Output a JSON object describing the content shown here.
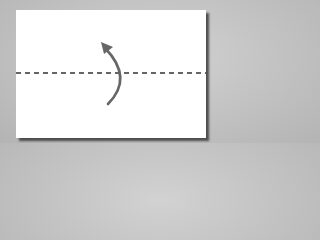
{
  "diagram": {
    "type": "origami-fold-step",
    "instruction": "valley fold in half (bottom edge up)",
    "paper": {
      "color": "#ffffff",
      "shape": "rectangle"
    },
    "fold_line": {
      "style": "dashed",
      "color": "#333333",
      "orientation": "horizontal",
      "position": "middle"
    },
    "arrow": {
      "color": "#666666",
      "direction": "up",
      "shape": "curved"
    },
    "background_color": "#c4c4c4"
  }
}
